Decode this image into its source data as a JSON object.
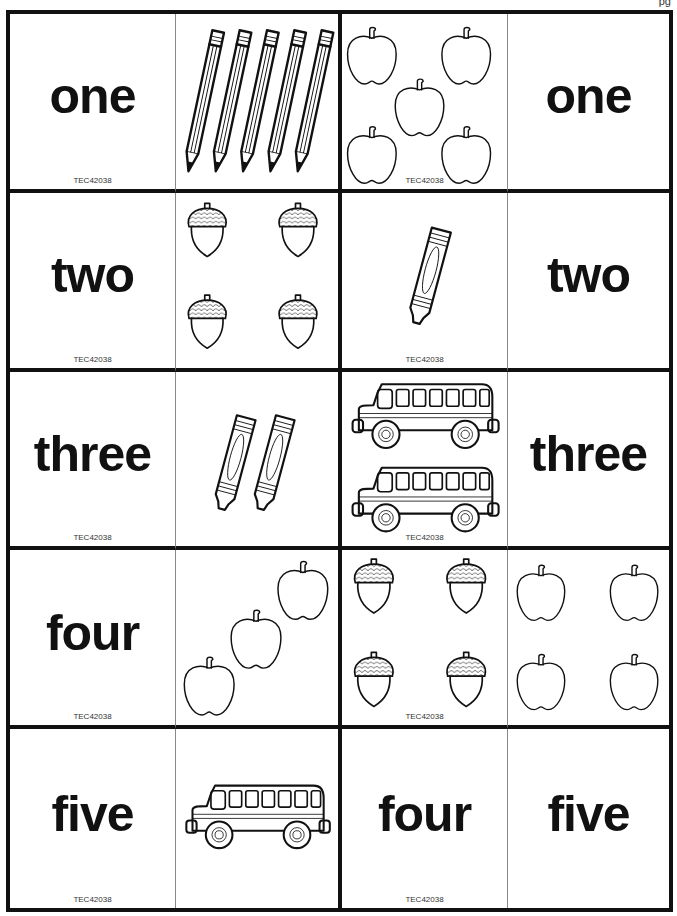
{
  "page": {
    "corner_text": "pg"
  },
  "card_code": "TEC42038",
  "rows": [
    {
      "left_word": "one",
      "left_picture": {
        "icon": "pencil-icon",
        "count": 5
      },
      "right_picture": {
        "icon": "apple-icon",
        "count": 5
      },
      "right_word": "one"
    },
    {
      "left_word": "two",
      "left_picture": {
        "icon": "acorn-icon",
        "count": 4
      },
      "right_picture": {
        "icon": "crayon-icon",
        "count": 1
      },
      "right_word": "two"
    },
    {
      "left_word": "three",
      "left_picture": {
        "icon": "crayon-icon",
        "count": 2
      },
      "right_picture": {
        "icon": "school-bus-icon",
        "count": 2
      },
      "right_word": "three"
    },
    {
      "left_word": "four",
      "left_picture": {
        "icon": "apple-icon",
        "count": 3
      },
      "right_picture": {
        "icon": "acorn-icon",
        "count": 4
      },
      "right_extra_picture": {
        "icon": "apple-icon",
        "count": 4
      }
    },
    {
      "left_word": "five",
      "left_picture": {
        "icon": "school-bus-icon",
        "count": 1
      },
      "right_word_a": "four",
      "right_word_b": "five"
    }
  ]
}
